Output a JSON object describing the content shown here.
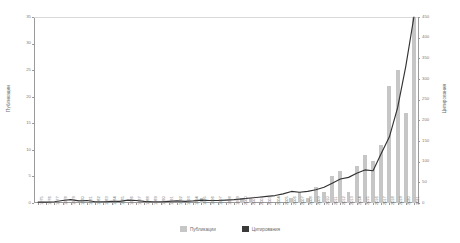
{
  "chart_data": {
    "type": "bar",
    "title": "",
    "subtitle": "",
    "xlabel": "",
    "ylabel": "Публикации",
    "y2label": "Цитирования",
    "grid": false,
    "legend_position": "bottom",
    "ylim": [
      0,
      35
    ],
    "y2lim": [
      0,
      450
    ],
    "yticks": [
      "0",
      "5",
      "10",
      "15",
      "20",
      "25",
      "30",
      "35"
    ],
    "y2ticks": [
      "0",
      "50",
      "100",
      "150",
      "200",
      "250",
      "300",
      "350",
      "400",
      "450"
    ],
    "categories": [
      "1975",
      "1976",
      "1977",
      "1978",
      "1979",
      "1980",
      "1981",
      "1982",
      "1983",
      "1984",
      "1985",
      "1986",
      "1987",
      "1988",
      "1989",
      "1990",
      "1991",
      "1992",
      "1993",
      "1994",
      "1995",
      "1996",
      "1997",
      "1998",
      "1999",
      "2000",
      "2001",
      "2002",
      "2003",
      "2004",
      "2005",
      "2006",
      "2007",
      "2008",
      "2009",
      "2010",
      "2011",
      "2012",
      "2013",
      "2014",
      "2015",
      "2016",
      "2017",
      "2018",
      "2019",
      "2020",
      "2021"
    ],
    "series": [
      {
        "name": "Публикации",
        "type": "bar",
        "axis": "left",
        "color": "#c6c6c6",
        "values": [
          0,
          0,
          0,
          0,
          0,
          0,
          0,
          0,
          0,
          0,
          0,
          0,
          0,
          0,
          0,
          0,
          0,
          0,
          0,
          0,
          1,
          0,
          0,
          0,
          0,
          1,
          1,
          0,
          0,
          0,
          0,
          1,
          2,
          1,
          3,
          2,
          5,
          6,
          2,
          7,
          9,
          8,
          11,
          22,
          25,
          17,
          35
        ]
      },
      {
        "name": "Цитирования",
        "type": "line",
        "axis": "right",
        "color": "#333333",
        "values": [
          2,
          2,
          3,
          6,
          8,
          5,
          6,
          3,
          3,
          4,
          4,
          7,
          6,
          4,
          3,
          3,
          4,
          5,
          4,
          5,
          7,
          6,
          6,
          7,
          8,
          10,
          12,
          14,
          16,
          18,
          22,
          28,
          26,
          28,
          32,
          38,
          48,
          58,
          62,
          72,
          80,
          78,
          120,
          160,
          230,
          330,
          450
        ]
      }
    ],
    "legend": [
      "Публикации",
      "Цитирования"
    ]
  },
  "legend": {
    "publications": "Публикации",
    "citations": "Цитирования"
  }
}
